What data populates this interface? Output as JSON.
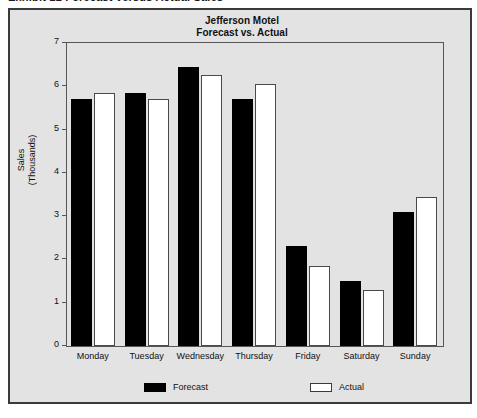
{
  "caption": {
    "text": "Exhibit 12   Forecast versus Actual Sales"
  },
  "figure": {
    "background_color": "#e3e3e3",
    "border_color": "#3a3a3a"
  },
  "chart_data": {
    "type": "bar",
    "title": "Jefferson Motel",
    "subtitle": "Forecast vs. Actual",
    "categories": [
      "Monday",
      "Tuesday",
      "Wednesday",
      "Thursday",
      "Friday",
      "Saturday",
      "Sunday"
    ],
    "series": [
      {
        "name": "Forecast",
        "color": "#000000",
        "values": [
          5.7,
          5.85,
          6.45,
          5.7,
          2.3,
          1.5,
          3.1
        ]
      },
      {
        "name": "Actual",
        "color": "#ffffff",
        "values": [
          5.85,
          5.7,
          6.25,
          6.05,
          1.85,
          1.3,
          3.45
        ]
      }
    ],
    "xlabel": "",
    "ylabel": "Sales (Thousands)",
    "ylabel_lines": [
      "Sales",
      "(Thousands)"
    ],
    "ylim": [
      0,
      7
    ],
    "yticks": [
      0,
      1,
      2,
      3,
      4,
      5,
      6,
      7
    ],
    "ytick_labels": [
      "0",
      "1",
      "2",
      "3",
      "4",
      "5",
      "6",
      "7"
    ],
    "grid": false,
    "legend_position": "bottom",
    "legend_entries": [
      "Forecast",
      "Actual"
    ]
  }
}
